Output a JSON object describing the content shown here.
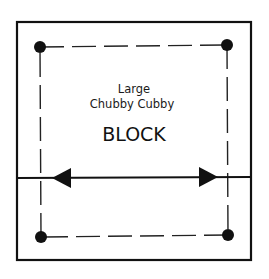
{
  "diagram": {
    "title_line1": "Large",
    "title_line2": "Chubby Cubby",
    "title_line3": "BLOCK",
    "outer_square": {
      "x": 17,
      "y": 22,
      "width": 234,
      "height": 238
    },
    "dashed_square": {
      "corners": [
        [
          40,
          47
        ],
        [
          227,
          45
        ],
        [
          228,
          235
        ],
        [
          41,
          237
        ]
      ]
    },
    "corner_dots": [
      "top-left",
      "top-right",
      "bottom-right",
      "bottom-left"
    ],
    "arrow": {
      "type": "double-headed",
      "y": 178,
      "from_x": 52,
      "to_x": 218
    },
    "colors": {
      "stroke": "#111111",
      "background": "#ffffff"
    }
  }
}
